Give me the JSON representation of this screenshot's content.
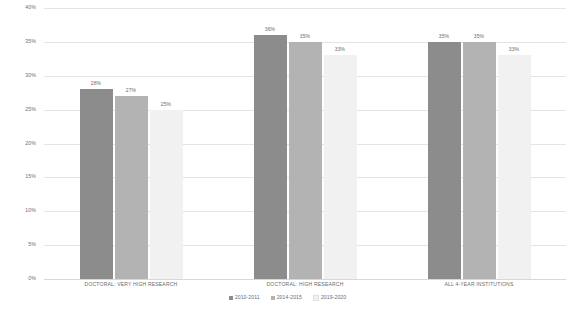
{
  "chart_data": {
    "type": "bar",
    "title": "",
    "subtitle": "",
    "xlabel": "",
    "ylabel": "",
    "ylim": [
      0,
      40
    ],
    "y_tick_labels": [
      "40%",
      "35%",
      "30%",
      "25%",
      "20%",
      "15%",
      "10%",
      "5%",
      "0%"
    ],
    "y_tick_values": [
      40,
      35,
      30,
      25,
      20,
      15,
      10,
      5,
      0
    ],
    "grid": true,
    "legend_position": "bottom",
    "categories": [
      "DOCTORAL: VERY HIGH RESEARCH",
      "DOCTORAL: HIGH RESEARCH",
      "ALL 4-YEAR INSTITUTIONS"
    ],
    "series": [
      {
        "name": "2010-2011",
        "color": "#8c8c8c",
        "values": [
          28,
          36,
          35
        ],
        "labels": [
          "28%",
          "36%",
          "35%"
        ]
      },
      {
        "name": "2014-2015",
        "color": "#b3b3b3",
        "values": [
          27,
          35,
          35
        ],
        "labels": [
          "27%",
          "35%",
          "35%"
        ]
      },
      {
        "name": "2019-2020",
        "color": "#f1f1f1",
        "values": [
          25,
          33,
          33
        ],
        "labels": [
          "25%",
          "33%",
          "33%"
        ]
      }
    ]
  },
  "colors": {
    "series_2010_2011": "#8c8c8c",
    "series_2014_2015": "#b3b3b3",
    "series_2019_2020": "#f1f1f1",
    "gridline": "#e4e4e4",
    "text": "#6b6b6b",
    "background": "#ffffff"
  }
}
